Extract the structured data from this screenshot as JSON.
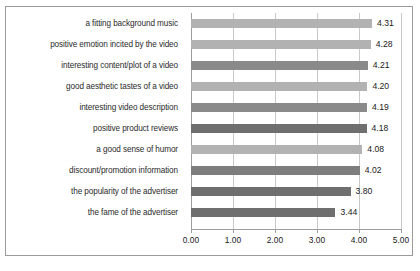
{
  "chart_data": {
    "type": "bar",
    "orientation": "horizontal",
    "title": "",
    "subtitle": "",
    "xlabel": "",
    "ylabel": "",
    "xlim": [
      0,
      5
    ],
    "xticks": [
      "0.00",
      "1.00",
      "2.00",
      "3.00",
      "4.00",
      "5.00"
    ],
    "xtick_values": [
      0,
      1,
      2,
      3,
      4,
      5
    ],
    "grid": true,
    "legend": "none",
    "value_label_format": "0.00",
    "categories": [
      "a fitting background music",
      "positive emotion incited by the video",
      "interesting content/plot of a video",
      "good aesthetic tastes of a video",
      "interesting video description",
      "positive product reviews",
      "a good sense of humor",
      "discount/promotion information",
      "the popularity of the advertiser",
      "the fame of the advertiser"
    ],
    "values": [
      4.31,
      4.28,
      4.21,
      4.2,
      4.19,
      4.18,
      4.08,
      4.02,
      3.8,
      3.44
    ],
    "value_labels": [
      "4.31",
      "4.28",
      "4.21",
      "4.20",
      "4.19",
      "4.18",
      "4.08",
      "4.02",
      "3.80",
      "3.44"
    ],
    "bar_colors": [
      "#b2b2b2",
      "#b2b2b2",
      "#8a8a8a",
      "#b2b2b2",
      "#8a8a8a",
      "#6f6f6f",
      "#b2b2b2",
      "#7d7d7d",
      "#6f6f6f",
      "#6f6f6f"
    ]
  },
  "style": {
    "grid_color": "#c9c9c9",
    "axis_color": "#9d9d9d",
    "border_color": "#9a9a9a",
    "text_color": "#1a1a1a",
    "background": "#ffffff"
  }
}
